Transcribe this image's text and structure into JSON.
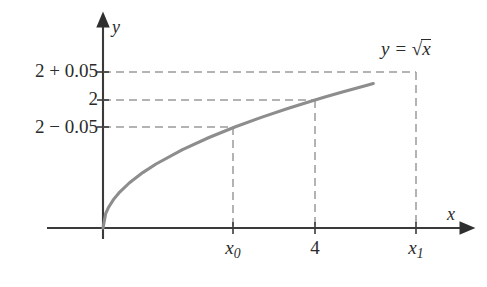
{
  "chart_data": {
    "type": "line",
    "title": "",
    "subtitle": "",
    "xlabel": "x",
    "ylabel": "y",
    "function_label": "y = √x",
    "function_expression": "sqrt(x)",
    "xlim": [
      0,
      5.1
    ],
    "ylim": [
      0,
      2.45
    ],
    "grid": false,
    "legend": "none",
    "curve_color": "#8d8d8d",
    "axis_color": "#3a3a3a",
    "guide_color": "#9a9a9a",
    "x": [
      0,
      0.05,
      0.1,
      0.2,
      0.3,
      0.5,
      0.75,
      1,
      1.5,
      2,
      2.5,
      3,
      3.5,
      3.8025,
      4,
      4.2025,
      4.5,
      5,
      5.1
    ],
    "y": [
      0,
      0.2236,
      0.3162,
      0.4472,
      0.5477,
      0.7071,
      0.866,
      1,
      1.2247,
      1.4142,
      1.5811,
      1.7321,
      1.8708,
      1.95,
      2,
      2.05,
      2.1213,
      2.2361,
      2.2583
    ],
    "annotations": [
      {
        "name": "point-x0",
        "x": 3.8025,
        "y": 1.95,
        "label": "(x₀, 2 − 0.05)"
      },
      {
        "name": "point-4",
        "x": 4,
        "y": 2,
        "label": "(4, 2)"
      },
      {
        "name": "point-x1",
        "x": 4.2025,
        "y": 2.05,
        "label": "(x₁, 2 + 0.05)"
      }
    ],
    "y_ticks": [
      {
        "value": 1.95,
        "label_parts": [
          "2",
          "−",
          "0.05"
        ],
        "label": "2 − 0.05"
      },
      {
        "value": 2.0,
        "label_parts": [
          "2"
        ],
        "label": "2"
      },
      {
        "value": 2.05,
        "label_parts": [
          "2",
          "+",
          "0.05"
        ],
        "label": "2 + 0.05"
      }
    ],
    "x_ticks": [
      {
        "value": 3.8025,
        "label": "x₀",
        "base": "x",
        "sub": "0"
      },
      {
        "value": 4.0,
        "label": "4",
        "base": "4",
        "sub": ""
      },
      {
        "value": 4.2025,
        "label": "x₁",
        "base": "x",
        "sub": "1"
      }
    ]
  },
  "axes": {
    "y_axis_name": "y",
    "x_axis_name": "x"
  },
  "curve_label": {
    "lhs": "y",
    "equals": "=",
    "radicand": "x"
  },
  "y_tick_labels": {
    "upper": {
      "base": "2",
      "op": "+",
      "delta": "0.05"
    },
    "middle": {
      "base": "2",
      "op": "",
      "delta": ""
    },
    "lower": {
      "base": "2",
      "op": "−",
      "delta": "0.05"
    }
  },
  "x_tick_labels": {
    "first": {
      "base": "x",
      "sub": "0"
    },
    "second": {
      "base": "4",
      "sub": ""
    },
    "third": {
      "base": "x",
      "sub": "1"
    }
  }
}
